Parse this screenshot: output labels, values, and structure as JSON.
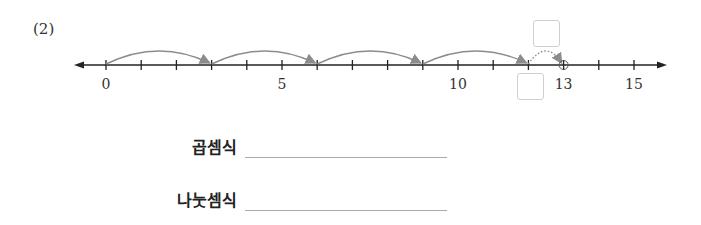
{
  "problem": {
    "number": "(2)"
  },
  "number_line": {
    "min": 0,
    "max": 16,
    "tick_step": 1,
    "labels": [
      {
        "value": 0,
        "text": "0"
      },
      {
        "value": 5,
        "text": "5"
      },
      {
        "value": 10,
        "text": "10"
      },
      {
        "value": 13,
        "text": "13"
      },
      {
        "value": 15,
        "text": "15"
      }
    ],
    "jumps": [
      {
        "from": 0,
        "to": 3,
        "style": "solid"
      },
      {
        "from": 3,
        "to": 6,
        "style": "solid"
      },
      {
        "from": 6,
        "to": 9,
        "style": "solid"
      },
      {
        "from": 9,
        "to": 12,
        "style": "solid"
      },
      {
        "from": 12,
        "to": 13,
        "style": "dotted"
      }
    ],
    "marked_point": 13,
    "colors": {
      "axis": "#222222",
      "jump": "#8c8c8c",
      "box_border": "#cfcfcf"
    }
  },
  "answer_boxes": [
    {
      "name": "remainder-box",
      "position": "above",
      "value": ""
    },
    {
      "name": "quotient-box",
      "position": "below",
      "value": ""
    }
  ],
  "equations": {
    "multiplication_label": "곱셈식",
    "multiplication_value": "",
    "division_label": "나눗셈식",
    "division_value": ""
  }
}
